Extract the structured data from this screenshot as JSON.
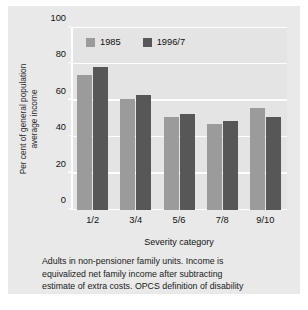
{
  "chart_data": {
    "type": "bar",
    "title": "",
    "xlabel": "Severity category",
    "ylabel_line1": "Per cent of general population",
    "ylabel_line2": "average income",
    "categories": [
      "1/2",
      "3/4",
      "5/6",
      "7/8",
      "9/10"
    ],
    "series": [
      {
        "name": "1985",
        "color": "#9b9b9b",
        "values": [
          74,
          61,
          51,
          47.5,
          56
        ]
      },
      {
        "name": "1996/7",
        "color": "#575757",
        "values": [
          78.5,
          63,
          52.5,
          49,
          51
        ]
      }
    ],
    "ylim": [
      0,
      100
    ],
    "yticks": [
      0,
      20,
      40,
      60,
      80,
      100
    ],
    "ytick_labels": [
      "0",
      "20",
      "40",
      "60",
      "80",
      "100"
    ],
    "grid": true,
    "grid_color": "#fdfdfd",
    "legend_position": "top-left-inside",
    "plot_background": "#e4e4e4",
    "figure_background": "#e9e9e9",
    "footnote_lines": [
      "Adults in non-pensioner family units. Income is",
      "equivalized net family income after subtracting",
      "estimate of extra costs. OPCS definition of disability"
    ]
  }
}
